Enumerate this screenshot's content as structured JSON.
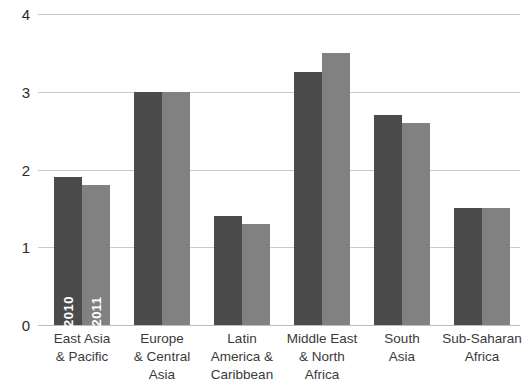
{
  "chart_data": {
    "type": "bar",
    "title": "",
    "subtitle": "",
    "xlabel": "",
    "ylabel": "",
    "ylim": [
      0,
      4
    ],
    "yticks": [
      0,
      1,
      2,
      3,
      4
    ],
    "ytick_labels": [
      "0",
      "1",
      "2",
      "3",
      "4"
    ],
    "grid": true,
    "legend": "in-bar vertical labels on first category",
    "categories": [
      "East Asia\n& Pacific",
      "Europe\n& Central\nAsia",
      "Latin\nAmerica &\nCaribbean",
      "Middle East\n& North\nAfrica",
      "South\nAsia",
      "Sub-Saharan\nAfrica"
    ],
    "category_lines": [
      [
        "East Asia",
        "& Pacific"
      ],
      [
        "Europe",
        "& Central",
        "Asia"
      ],
      [
        "Latin",
        "America &",
        "Caribbean"
      ],
      [
        "Middle East",
        "& North",
        "Africa"
      ],
      [
        "South",
        "Asia"
      ],
      [
        "Sub-Saharan",
        "Africa"
      ]
    ],
    "series": [
      {
        "name": "2010",
        "color": "#4b4b4b",
        "values": [
          1.9,
          3.0,
          1.4,
          3.25,
          2.7,
          1.5
        ]
      },
      {
        "name": "2011",
        "color": "#818181",
        "values": [
          1.8,
          3.0,
          1.3,
          3.5,
          2.6,
          1.5
        ]
      }
    ]
  },
  "axis": {
    "ytick_labels": [
      "4",
      "3",
      "2",
      "1",
      "0"
    ]
  },
  "colors": {
    "series_2010": "#4b4b4b",
    "series_2011": "#818181",
    "gridline": "#c9c9c9",
    "baseline": "#bdbdbd",
    "text": "#2b2b2b",
    "background": "#ffffff"
  }
}
